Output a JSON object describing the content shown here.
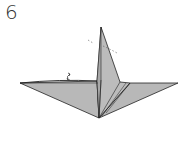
{
  "diagram": {
    "step_number": "6",
    "colors": {
      "paper": "#b4b4b4",
      "paper_light": "#c4c4c4",
      "line": "#222222",
      "background": "#ffffff"
    },
    "annotations": [
      {
        "type": "rotate-arrow-icon",
        "description": "small double-headed curved arrow near left wing"
      },
      {
        "type": "dashed-fold-line",
        "description": "dashed line indicating fold at top of central spike"
      }
    ]
  }
}
